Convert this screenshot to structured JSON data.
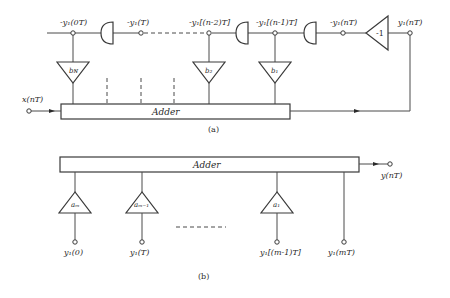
{
  "diagram_a": {
    "caption": "(a)",
    "adder_label": "Adder",
    "input_label": "x(nT)",
    "top_nodes": [
      {
        "label": "-y₁(0T)"
      },
      {
        "label": "-y₁(T)"
      },
      {
        "label": "-y₁[(n-2)T]"
      },
      {
        "label": "-y₁[(n-1)T]"
      },
      {
        "label": "-y₁(nT)"
      },
      {
        "label": "y₁(nT)"
      }
    ],
    "inverter_gain": "-1",
    "multipliers": [
      {
        "label": "b_N",
        "text": "bɴ"
      },
      {
        "label": "b_2",
        "text": "b₂"
      },
      {
        "label": "b_1",
        "text": "b₁"
      }
    ]
  },
  "diagram_b": {
    "caption": "(b)",
    "adder_label": "Adder",
    "output_label": "y(nT)",
    "multipliers": [
      {
        "label": "a_m",
        "text": "aₘ"
      },
      {
        "label": "a_m-1",
        "text": "aₘ₋₁"
      },
      {
        "label": "a_1",
        "text": "a₁"
      }
    ],
    "input_nodes": [
      {
        "label": "y₁(0)"
      },
      {
        "label": "y₁(T)"
      },
      {
        "label": "y₁[(m-1)T]"
      },
      {
        "label": "y₁(mT)"
      }
    ]
  }
}
